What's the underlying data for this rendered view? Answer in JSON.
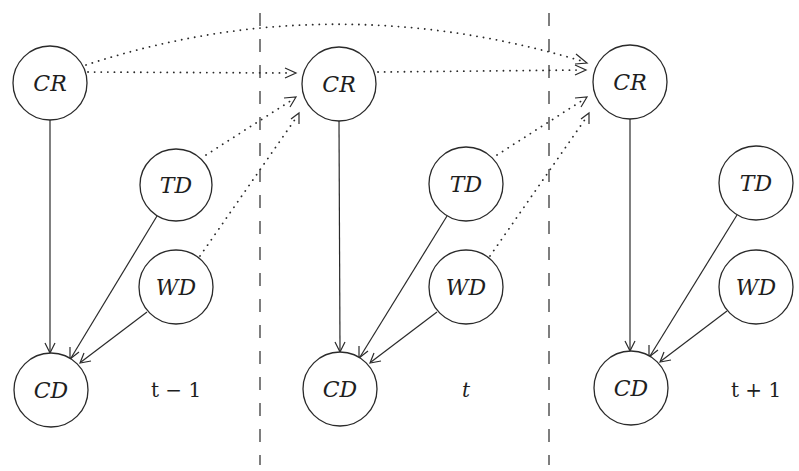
{
  "diagram": {
    "type": "dynamic-bayesian-network",
    "colors": {
      "stroke": "#2a2a2a",
      "background": "#ffffff"
    },
    "dividers": [
      {
        "x": 260,
        "y1": 13,
        "y2": 465
      },
      {
        "x": 549,
        "y1": 13,
        "y2": 465
      }
    ],
    "slices": [
      {
        "label": "t − 1",
        "label_pos": {
          "x": 176,
          "y": 397
        },
        "nodes": {
          "CR": {
            "label": "CR",
            "cx": 50,
            "cy": 83
          },
          "TD": {
            "label": "TD",
            "cx": 176,
            "cy": 185
          },
          "WD": {
            "label": "WD",
            "cx": 176,
            "cy": 287
          },
          "CD": {
            "label": "CD",
            "cx": 51,
            "cy": 390
          }
        }
      },
      {
        "label": "t",
        "label_pos": {
          "x": 466,
          "y": 397
        },
        "nodes": {
          "CR": {
            "label": "CR",
            "cx": 339,
            "cy": 84
          },
          "TD": {
            "label": "TD",
            "cx": 466,
            "cy": 184
          },
          "WD": {
            "label": "WD",
            "cx": 466,
            "cy": 287
          },
          "CD": {
            "label": "CD",
            "cx": 340,
            "cy": 389
          }
        }
      },
      {
        "label": "t + 1",
        "label_pos": {
          "x": 756,
          "y": 397
        },
        "nodes": {
          "CR": {
            "label": "CR",
            "cx": 630,
            "cy": 82
          },
          "TD": {
            "label": "TD",
            "cx": 756,
            "cy": 183
          },
          "WD": {
            "label": "WD",
            "cx": 756,
            "cy": 287
          },
          "CD": {
            "label": "CD",
            "cx": 631,
            "cy": 388
          }
        }
      }
    ],
    "node_radius": 37,
    "intra_slice_edges": [
      {
        "from": "CR",
        "to": "CD",
        "style": "solid"
      },
      {
        "from": "TD",
        "to": "CD",
        "style": "solid"
      },
      {
        "from": "WD",
        "to": "CD",
        "style": "solid"
      }
    ],
    "inter_slice_edges": [
      {
        "from": "CR(t-1)",
        "to": "CR(t)",
        "style": "dotted"
      },
      {
        "from": "TD(t-1)",
        "to": "CR(t)",
        "style": "dotted"
      },
      {
        "from": "WD(t-1)",
        "to": "CR(t)",
        "style": "dotted"
      },
      {
        "from": "CR(t-1)",
        "to": "CR(t+1)",
        "style": "dotted-arc"
      },
      {
        "from": "CR(t)",
        "to": "CR(t+1)",
        "style": "dotted"
      },
      {
        "from": "TD(t)",
        "to": "CR(t+1)",
        "style": "dotted"
      },
      {
        "from": "WD(t)",
        "to": "CR(t+1)",
        "style": "dotted"
      }
    ]
  }
}
